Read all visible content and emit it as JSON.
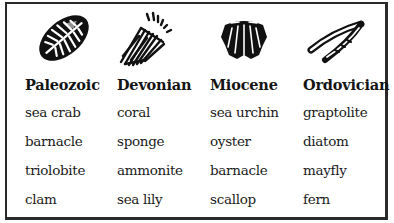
{
  "table": {
    "columns": [
      {
        "header": "Paleozoic",
        "icon": "sea-crab-fossil-icon",
        "items": [
          "sea crab",
          "barnacle",
          "triolobite",
          "clam"
        ]
      },
      {
        "header": "Devonian",
        "icon": "coral-fossil-icon",
        "items": [
          "coral",
          "sponge",
          "ammonite",
          "sea lily"
        ]
      },
      {
        "header": "Miocene",
        "icon": "scallop-shell-fossil-icon",
        "items": [
          "sea urchin",
          "oyster",
          "barnacle",
          "scallop"
        ]
      },
      {
        "header": "Ordovician",
        "icon": "graptolite-fossil-icon",
        "items": [
          "graptolite",
          "diatom",
          "mayfly",
          "fern"
        ]
      }
    ]
  },
  "colors": {
    "border": "#2a2a2a",
    "text": "#1a1a1a",
    "background": "#ffffff"
  }
}
